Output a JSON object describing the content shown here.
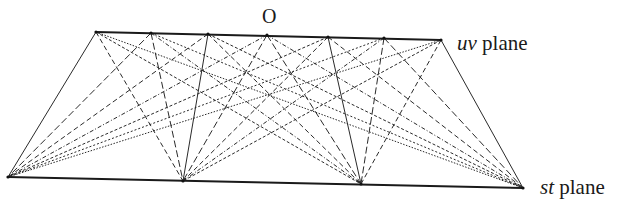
{
  "diagram": {
    "origin_label": "O",
    "uv_label": {
      "italic": "uv",
      "rest": " plane"
    },
    "st_label": {
      "italic": "st",
      "rest": " plane"
    },
    "line_color": "#2a2a2a",
    "uv_points": [
      [
        96,
        32
      ],
      [
        151,
        33
      ],
      [
        208,
        34
      ],
      [
        267,
        35
      ],
      [
        328,
        37
      ],
      [
        384,
        38
      ],
      [
        441,
        40
      ]
    ],
    "st_points": [
      [
        8,
        177
      ],
      [
        183,
        181
      ],
      [
        361,
        184
      ],
      [
        523,
        188
      ]
    ],
    "dash_styles": [
      "none",
      "7 3",
      "5 3",
      "4 2 1 2",
      "3 2",
      "2 2",
      "1.5 1.5"
    ]
  }
}
